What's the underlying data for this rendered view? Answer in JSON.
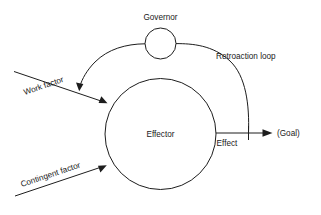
{
  "diagram": {
    "title_text": "",
    "background_color": "#ffffff",
    "line_color": "#1d1d1d",
    "text_color": "#1a1a1a",
    "nodes": [
      {
        "id": "governor",
        "label": "Governor",
        "shape": "circle",
        "cx": 160.5,
        "cy": 43.5,
        "r": 15.5,
        "label_x": 160.5,
        "label_y": 18
      },
      {
        "id": "effector",
        "label": "Effector",
        "shape": "circle",
        "cx": 160.5,
        "cy": 134,
        "r": 55.5,
        "label_x": 160.5,
        "label_y": 135
      }
    ],
    "edges": [
      {
        "id": "work-factor",
        "label": "Work factor",
        "from": "external-upper-left",
        "to": "effector",
        "label_rotation": -22
      },
      {
        "id": "contingent-factor",
        "label": "Contingent factor",
        "from": "external-lower-left",
        "to": "effector",
        "label_rotation": -20
      },
      {
        "id": "effect",
        "label": "Effect",
        "from": "effector",
        "to": "goal"
      },
      {
        "id": "retroaction-loop",
        "label": "Retroaction loop",
        "from": "effect-line",
        "to": "effector-via-governor"
      }
    ],
    "endpoints": [
      {
        "id": "goal",
        "label": "(Goal)",
        "x": 277,
        "y": 134
      }
    ]
  }
}
